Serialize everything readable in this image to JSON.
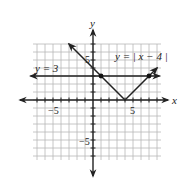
{
  "chart_data": {
    "type": "line",
    "title": "",
    "xlabel": "x",
    "ylabel": "y",
    "xlim": [
      -7.5,
      8.5
    ],
    "ylim": [
      -7.5,
      7
    ],
    "grid": true,
    "x_tick_labels": [
      {
        "value": -5,
        "label": "−5"
      },
      {
        "value": 5,
        "label": "5"
      }
    ],
    "y_tick_labels": [
      {
        "value": 5,
        "label": "5"
      },
      {
        "value": -5,
        "label": "−5"
      }
    ],
    "series": [
      {
        "name": "y = | x − 4 |",
        "kind": "absolute_value",
        "points": [
          [
            -3,
            7
          ],
          [
            4,
            0
          ],
          [
            8,
            4
          ]
        ],
        "arrows": "both",
        "color": "#222222"
      },
      {
        "name": "y = 3",
        "kind": "horizontal_line",
        "points": [
          [
            -7.8,
            3
          ],
          [
            8.3,
            3
          ]
        ],
        "arrows": "both",
        "color": "#222222"
      }
    ],
    "intersection_points": [
      [
        1,
        3
      ],
      [
        7,
        3
      ]
    ],
    "annotations": [
      {
        "text": "y = | x − 4 |",
        "position": [
          4,
          5.5
        ]
      },
      {
        "text": "y = 3",
        "position": [
          -7,
          3.6
        ]
      }
    ]
  },
  "labels": {
    "x_axis": "x",
    "y_axis": "y",
    "x_neg5": "−5",
    "x_pos5": "5",
    "y_pos5": "5",
    "y_neg5": "−5",
    "abs_eq": "y = | x − 4 |",
    "const_eq": "y = 3"
  }
}
